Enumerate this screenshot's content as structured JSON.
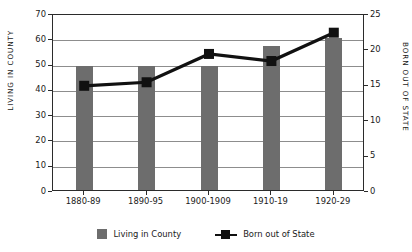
{
  "chart_data": {
    "type": "bar",
    "title": "",
    "xlabel": "",
    "categories": [
      "1880-89",
      "1890-95",
      "1900-1909",
      "1910-19",
      "1920-29"
    ],
    "grid": true,
    "legend_position": "bottom",
    "series": [
      {
        "name": "Living in County",
        "type": "bar",
        "axis": "left",
        "color": "#6d6d6d",
        "values": [
          49,
          49,
          49,
          57,
          60
        ]
      },
      {
        "name": "Born out of State",
        "type": "line",
        "axis": "right",
        "color": "#111111",
        "marker": "square",
        "values": [
          15,
          15.5,
          19.5,
          18.5,
          22.5
        ]
      }
    ],
    "axes": {
      "left": {
        "label": "LIVING IN COUNTY",
        "ylim": [
          0,
          70
        ],
        "ticks": [
          0,
          10,
          20,
          30,
          40,
          50,
          60,
          70
        ],
        "tick_labels": [
          "0",
          "10",
          "20",
          "30",
          "40",
          "50",
          "60",
          "70"
        ]
      },
      "right": {
        "label": "BORN OUT OF STATE",
        "ylim": [
          0,
          25
        ],
        "ticks": [
          0,
          5,
          10,
          15,
          20,
          25
        ],
        "tick_labels": [
          "0",
          "5",
          "10",
          "15",
          "20",
          "25"
        ]
      }
    }
  },
  "legend": {
    "items": [
      {
        "label": "Living in County",
        "marker": "bar-swatch"
      },
      {
        "label": "Born out of State",
        "marker": "line-square-swatch"
      }
    ]
  }
}
